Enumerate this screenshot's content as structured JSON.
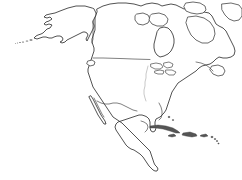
{
  "figure": {
    "kind": "outline-map",
    "projection_look": "conic",
    "background_color": "#ffffff",
    "outline_color": "#333333",
    "border_color": "#4a4a4a",
    "river_color": "#9a9a9a",
    "island_fill_color": "#555555",
    "has_labels": false,
    "has_legend": false,
    "has_graticule": false,
    "has_scale_bar": false,
    "has_north_arrow": false,
    "line_style": "thin continuous contour",
    "width_px": 242,
    "height_px": 180
  },
  "landmasses": [
    {
      "name": "alaska",
      "label": "Alaska"
    },
    {
      "name": "canada-mainland",
      "label": "Canada mainland"
    },
    {
      "name": "united-states-mainland",
      "label": "Contiguous United States"
    },
    {
      "name": "mexico",
      "label": "Mexico"
    },
    {
      "name": "central-america",
      "label": "Central America"
    },
    {
      "name": "baja-california",
      "label": "Baja California Peninsula"
    },
    {
      "name": "florida-peninsula",
      "label": "Florida Peninsula"
    },
    {
      "name": "yucatan-peninsula",
      "label": "Yucatan Peninsula"
    },
    {
      "name": "labrador",
      "label": "Labrador"
    }
  ],
  "islands": [
    {
      "name": "baffin-island",
      "label": "Baffin Island"
    },
    {
      "name": "ellesmere-island",
      "label": "Ellesmere Island"
    },
    {
      "name": "victoria-island",
      "label": "Victoria Island"
    },
    {
      "name": "banks-island",
      "label": "Banks Island"
    },
    {
      "name": "greenland-edge",
      "label": "Greenland western edge"
    },
    {
      "name": "newfoundland",
      "label": "Newfoundland"
    },
    {
      "name": "vancouver-island",
      "label": "Vancouver Island"
    },
    {
      "name": "cuba",
      "label": "Cuba"
    },
    {
      "name": "hispaniola",
      "label": "Hispaniola"
    },
    {
      "name": "puerto-rico",
      "label": "Puerto Rico"
    },
    {
      "name": "jamaica",
      "label": "Jamaica"
    },
    {
      "name": "lesser-antilles",
      "label": "Lesser Antilles"
    },
    {
      "name": "bahamas",
      "label": "Bahamas"
    },
    {
      "name": "aleutian-islands",
      "label": "Aleutian Islands"
    }
  ],
  "water_bodies": [
    {
      "name": "hudson-bay",
      "label": "Hudson Bay"
    },
    {
      "name": "great-lakes",
      "label": "Great Lakes"
    },
    {
      "name": "gulf-of-california",
      "label": "Gulf of California"
    },
    {
      "name": "gulf-of-mexico",
      "label": "Gulf of Mexico"
    },
    {
      "name": "gulf-of-st-lawrence",
      "label": "Gulf of St. Lawrence"
    },
    {
      "name": "caribbean-sea",
      "label": "Caribbean Sea"
    }
  ],
  "boundaries": [
    {
      "name": "us-canada-border",
      "label": "United States – Canada border",
      "style": "straight parallel"
    },
    {
      "name": "us-mexico-border",
      "label": "United States – Mexico border",
      "style": "irregular"
    },
    {
      "name": "alaska-canada-border",
      "label": "Alaska – Canada border",
      "style": "straight meridian"
    },
    {
      "name": "mississippi-river",
      "label": "Mississippi River",
      "style": "faint wavy"
    }
  ]
}
